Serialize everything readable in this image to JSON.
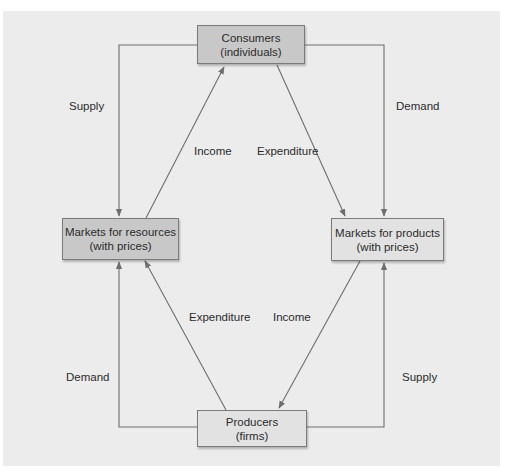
{
  "diagram": {
    "type": "circular-flow",
    "nodes": {
      "consumers": {
        "line1": "Consumers",
        "line2": "(individuals)",
        "fill": "#c8c8c8"
      },
      "resource_markets": {
        "line1": "Markets for resources",
        "line2": "(with prices)",
        "fill": "#c8c8c8"
      },
      "product_markets": {
        "line1": "Markets for products",
        "line2": "(with prices)",
        "fill": "#e2e2e2"
      },
      "producers": {
        "line1": "Producers",
        "line2": "(firms)",
        "fill": "#e2e2e2"
      }
    },
    "edges": {
      "consumers_supply": {
        "label": "Supply",
        "from": "consumers",
        "to": "resource_markets"
      },
      "consumers_demand": {
        "label": "Demand",
        "from": "consumers",
        "to": "product_markets"
      },
      "income_top": {
        "label": "Income",
        "from": "resource_markets",
        "to": "consumers"
      },
      "expenditure_top": {
        "label": "Expenditure",
        "from": "consumers",
        "to": "product_markets"
      },
      "expenditure_bottom": {
        "label": "Expenditure",
        "from": "producers",
        "to": "resource_markets"
      },
      "income_bottom": {
        "label": "Income",
        "from": "product_markets",
        "to": "producers"
      },
      "producers_demand": {
        "label": "Demand",
        "from": "producers",
        "to": "resource_markets"
      },
      "producers_supply": {
        "label": "Supply",
        "from": "producers",
        "to": "product_markets"
      }
    },
    "colors": {
      "panel": "#ececec",
      "line": "#6e6e6e",
      "text": "#2b2b2b"
    }
  }
}
